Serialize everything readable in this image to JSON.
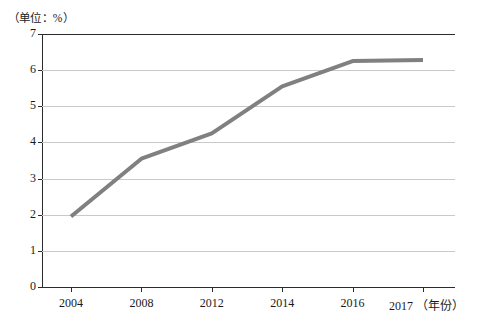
{
  "unit_label": "（单位：%）",
  "axis_suffix": "（年份）",
  "colors": {
    "line": "#808080",
    "axis": "#2b2b2b",
    "grid": "#c9c9c9",
    "text": "#1a1a1a",
    "background": "#ffffff"
  },
  "chart_data": {
    "type": "line",
    "title": "",
    "subtitle": "",
    "xlabel": "年份",
    "ylabel": "",
    "unit": "%",
    "unit_note": "（单位：%）",
    "categories": [
      "2004",
      "2008",
      "2012",
      "2014",
      "2016",
      "2017"
    ],
    "x": [
      2004,
      2008,
      2012,
      2014,
      2016,
      2017
    ],
    "values": [
      1.95,
      3.55,
      4.25,
      5.55,
      6.25,
      6.28
    ],
    "series": [
      {
        "name": "比重",
        "values": [
          1.95,
          3.55,
          4.25,
          5.55,
          6.25,
          6.28
        ],
        "color": "#808080"
      }
    ],
    "ylim": [
      0,
      7
    ],
    "yticks": [
      0,
      1,
      2,
      3,
      4,
      5,
      6,
      7
    ],
    "ytick_labels": [
      "0",
      "1",
      "2",
      "3",
      "4",
      "5",
      "6",
      "7"
    ],
    "xtick_labels": [
      "2004",
      "2008",
      "2012",
      "2014",
      "2016",
      "2017"
    ],
    "grid": true,
    "grid_axis": "y",
    "legend": false,
    "legend_position": "none",
    "markers": false,
    "line_width": 4
  }
}
